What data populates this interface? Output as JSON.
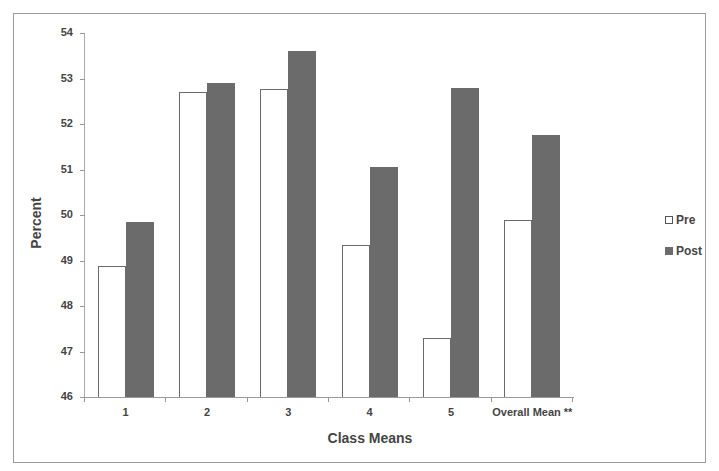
{
  "chart_data": {
    "type": "bar",
    "title": "",
    "xlabel": "Class Means",
    "ylabel": "Percent",
    "categories": [
      "1",
      "2",
      "3",
      "4",
      "5",
      "Overall Mean **"
    ],
    "series": [
      {
        "name": "Pre",
        "color": "#ffffff",
        "values": [
          48.88,
          52.7,
          52.78,
          49.34,
          47.3,
          49.9
        ]
      },
      {
        "name": "Post",
        "color": "#6b6b6b",
        "values": [
          49.85,
          52.9,
          53.6,
          51.05,
          52.8,
          51.76
        ]
      }
    ],
    "ylim": [
      46,
      54
    ],
    "yticks": [
      "46",
      "47",
      "48",
      "49",
      "50",
      "51",
      "52",
      "53",
      "54"
    ],
    "grid": false,
    "legend_position": "right"
  },
  "legend": {
    "pre": "Pre",
    "post": "Post"
  },
  "axes": {
    "x_title": "Class Means",
    "y_title": "Percent"
  }
}
